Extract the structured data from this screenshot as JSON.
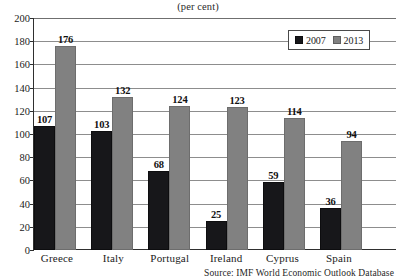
{
  "figure": {
    "title_remnant": "Public debt",
    "subtitle": "(per cent)",
    "source_note": "Source: IMF World Economic Outlook Database"
  },
  "legend": {
    "position": "top-right",
    "items": [
      {
        "label": "2007",
        "color": "#17171a",
        "swatch_name": "legend-swatch-2007"
      },
      {
        "label": "2013",
        "color": "#818181",
        "swatch_name": "legend-swatch-2013"
      }
    ]
  },
  "chart_data": {
    "type": "bar",
    "subtitle": "(per cent)",
    "xlabel": "",
    "ylabel": "",
    "ylim": [
      0,
      200
    ],
    "yticks": [
      0,
      20,
      40,
      60,
      80,
      100,
      120,
      140,
      160,
      180,
      200
    ],
    "ytick_labels": [
      "0",
      "20",
      "40",
      "60",
      "80",
      "100",
      "120",
      "140",
      "160",
      "180",
      "200"
    ],
    "grid": true,
    "grid_axis": "y",
    "legend_position": "top-right",
    "categories": [
      "Greece",
      "Italy",
      "Portugal",
      "Ireland",
      "Cyprus",
      "Spain"
    ],
    "series": [
      {
        "name": "2007",
        "color": "#17171a",
        "values": [
          107,
          103,
          68,
          25,
          59,
          36
        ],
        "labels": [
          "107",
          "103",
          "68",
          "25",
          "59",
          "36"
        ]
      },
      {
        "name": "2013",
        "color": "#818181",
        "values": [
          176,
          132,
          124,
          123,
          114,
          94
        ],
        "labels": [
          "176",
          "132",
          "124",
          "123",
          "114",
          "94"
        ]
      }
    ],
    "source": "Source: IMF World Economic Outlook Database"
  }
}
